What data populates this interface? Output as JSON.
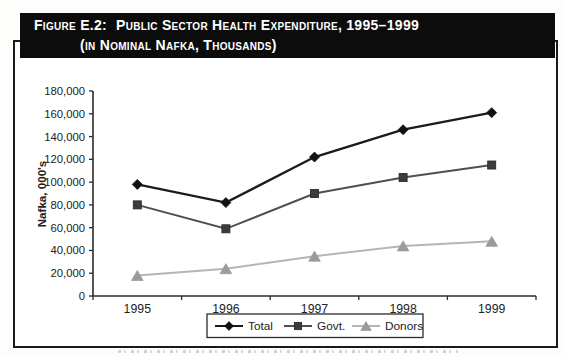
{
  "figure": {
    "label": "Figure E.2:",
    "title_line1": "Public Sector Health Expenditure, 1995–1999",
    "title_line2": "(in Nominal Nafka, Thousands)"
  },
  "chart_data": {
    "type": "line",
    "categories": [
      "1995",
      "1996",
      "1997",
      "1998",
      "1999"
    ],
    "series": [
      {
        "name": "Total",
        "marker": "diamond",
        "line_color": "#1b1b1b",
        "marker_color": "#111111",
        "values": [
          98000,
          82000,
          122000,
          146000,
          161000
        ]
      },
      {
        "name": "Govt.",
        "marker": "square",
        "line_color": "#4f4f4f",
        "marker_color": "#3c3c3c",
        "values": [
          80000,
          59000,
          90000,
          104000,
          115000
        ]
      },
      {
        "name": "Donors",
        "marker": "triangle",
        "line_color": "#b5b5b5",
        "marker_color": "#9b9b9b",
        "values": [
          18000,
          24000,
          35000,
          44000,
          48000
        ]
      }
    ],
    "xlabel": "",
    "ylabel": "Nafka, 000's",
    "ylim": [
      0,
      180000
    ],
    "ytick_step": 20000,
    "ytick_labels": [
      "0",
      "20,000",
      "40,000",
      "60,000",
      "80,000",
      "100,000",
      "120,000",
      "140,000",
      "160,000",
      "180,000"
    ],
    "grid": false,
    "legend_position": "bottom",
    "axis_color": "#2b2b2b",
    "text_color": "#222222"
  }
}
